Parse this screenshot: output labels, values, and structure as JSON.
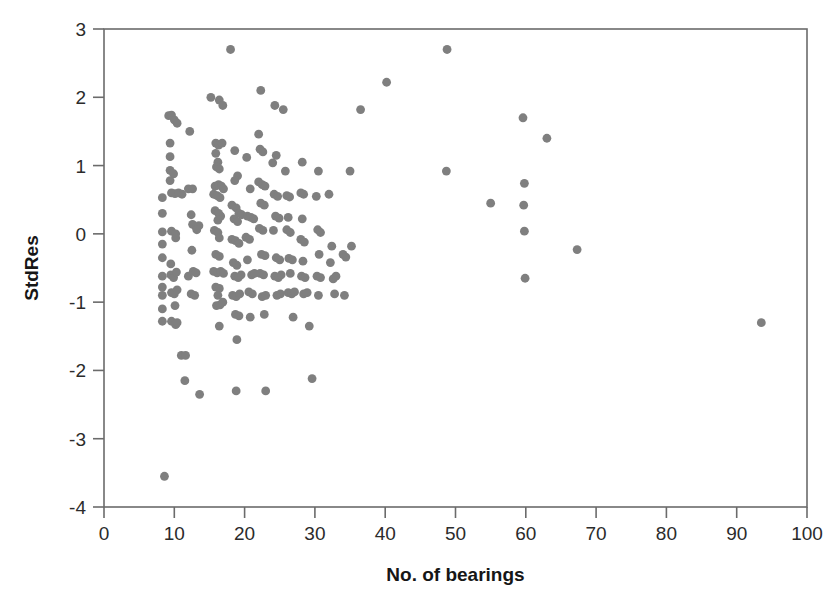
{
  "chart_data": {
    "type": "scatter",
    "title": "",
    "xlabel": "No. of bearings",
    "ylabel": "StdRes",
    "xlim": [
      0,
      100
    ],
    "ylim": [
      -4,
      3
    ],
    "xticks": [
      0,
      10,
      20,
      30,
      40,
      50,
      60,
      70,
      80,
      90,
      100
    ],
    "yticks": [
      -4,
      -3,
      -2,
      -1,
      0,
      1,
      2,
      3
    ],
    "xtick_labels": [
      "0",
      "10",
      "20",
      "30",
      "40",
      "50",
      "60",
      "70",
      "80",
      "90",
      "100"
    ],
    "ytick_labels": [
      "-4",
      "-3",
      "-2",
      "-1",
      "0",
      "1",
      "2",
      "3"
    ],
    "grid": false,
    "legend": null,
    "marker": {
      "shape": "circle",
      "color": "#7f7f7f",
      "size": 4.4
    },
    "series": [
      {
        "name": "residuals",
        "points": [
          [
            8.6,
            -3.55
          ],
          [
            8.3,
            0.53
          ],
          [
            8.3,
            0.3
          ],
          [
            8.3,
            0.03
          ],
          [
            8.3,
            -0.15
          ],
          [
            8.3,
            -0.35
          ],
          [
            8.3,
            -0.62
          ],
          [
            8.3,
            -0.78
          ],
          [
            8.3,
            -0.9
          ],
          [
            8.3,
            -1.1
          ],
          [
            8.3,
            -1.28
          ],
          [
            9.2,
            1.73
          ],
          [
            9.6,
            1.74
          ],
          [
            10.0,
            1.67
          ],
          [
            10.4,
            1.62
          ],
          [
            9.4,
            1.33
          ],
          [
            9.4,
            1.13
          ],
          [
            9.4,
            0.93
          ],
          [
            9.9,
            0.88
          ],
          [
            9.4,
            0.78
          ],
          [
            9.6,
            0.6
          ],
          [
            10.1,
            0.59
          ],
          [
            10.6,
            0.6
          ],
          [
            11.1,
            0.58
          ],
          [
            9.6,
            0.04
          ],
          [
            10.2,
            0.0
          ],
          [
            10.2,
            -0.06
          ],
          [
            9.5,
            -0.44
          ],
          [
            9.5,
            -0.6
          ],
          [
            9.9,
            -0.64
          ],
          [
            10.3,
            -0.56
          ],
          [
            9.6,
            -0.86
          ],
          [
            10.0,
            -0.88
          ],
          [
            10.4,
            -0.82
          ],
          [
            10.1,
            -1.05
          ],
          [
            9.6,
            -1.28
          ],
          [
            10.2,
            -1.33
          ],
          [
            10.4,
            -1.3
          ],
          [
            11.0,
            -1.78
          ],
          [
            11.6,
            -1.78
          ],
          [
            11.5,
            -2.15
          ],
          [
            12.2,
            1.5
          ],
          [
            12.0,
            0.66
          ],
          [
            12.6,
            0.66
          ],
          [
            12.4,
            0.28
          ],
          [
            12.6,
            0.14
          ],
          [
            13.1,
            0.1
          ],
          [
            13.5,
            0.12
          ],
          [
            13.2,
            0.06
          ],
          [
            12.5,
            -0.24
          ],
          [
            12.0,
            -0.62
          ],
          [
            12.7,
            -0.55
          ],
          [
            13.1,
            -0.57
          ],
          [
            12.4,
            -0.88
          ],
          [
            12.9,
            -0.9
          ],
          [
            13.6,
            -2.35
          ],
          [
            15.2,
            2.0
          ],
          [
            16.4,
            1.96
          ],
          [
            16.9,
            1.88
          ],
          [
            15.9,
            1.33
          ],
          [
            16.3,
            1.3
          ],
          [
            16.8,
            1.33
          ],
          [
            15.9,
            1.18
          ],
          [
            16.2,
            1.05
          ],
          [
            16.0,
            0.98
          ],
          [
            16.4,
            0.95
          ],
          [
            15.8,
            0.7
          ],
          [
            16.3,
            0.72
          ],
          [
            16.7,
            0.7
          ],
          [
            17.0,
            0.66
          ],
          [
            15.6,
            0.58
          ],
          [
            16.1,
            0.56
          ],
          [
            16.5,
            0.53
          ],
          [
            15.8,
            0.34
          ],
          [
            16.3,
            0.3
          ],
          [
            16.6,
            0.26
          ],
          [
            16.2,
            0.2
          ],
          [
            15.7,
            0.05
          ],
          [
            16.2,
            0.02
          ],
          [
            16.4,
            -0.06
          ],
          [
            15.9,
            -0.3
          ],
          [
            16.4,
            -0.33
          ],
          [
            15.6,
            -0.55
          ],
          [
            16.1,
            -0.57
          ],
          [
            16.6,
            -0.55
          ],
          [
            17.0,
            -0.58
          ],
          [
            15.9,
            -0.78
          ],
          [
            16.4,
            -0.8
          ],
          [
            16.2,
            -0.9
          ],
          [
            16.0,
            -1.05
          ],
          [
            16.5,
            -1.04
          ],
          [
            16.9,
            -1.0
          ],
          [
            16.4,
            -1.35
          ],
          [
            18.0,
            2.7
          ],
          [
            18.6,
            1.22
          ],
          [
            19.0,
            0.85
          ],
          [
            18.6,
            0.78
          ],
          [
            18.2,
            0.42
          ],
          [
            18.8,
            0.38
          ],
          [
            19.2,
            0.3
          ],
          [
            19.6,
            0.28
          ],
          [
            18.5,
            0.22
          ],
          [
            19.0,
            0.18
          ],
          [
            18.2,
            -0.08
          ],
          [
            18.7,
            -0.1
          ],
          [
            19.2,
            -0.14
          ],
          [
            18.4,
            -0.42
          ],
          [
            18.9,
            -0.46
          ],
          [
            18.6,
            -0.62
          ],
          [
            19.1,
            -0.64
          ],
          [
            19.5,
            -0.6
          ],
          [
            18.3,
            -0.9
          ],
          [
            18.8,
            -0.92
          ],
          [
            19.3,
            -0.88
          ],
          [
            18.7,
            -1.18
          ],
          [
            19.2,
            -1.2
          ],
          [
            18.9,
            -1.55
          ],
          [
            18.8,
            -2.3
          ],
          [
            20.3,
            1.12
          ],
          [
            20.8,
            0.66
          ],
          [
            20.4,
            0.26
          ],
          [
            20.9,
            0.24
          ],
          [
            21.3,
            0.22
          ],
          [
            20.2,
            -0.05
          ],
          [
            20.7,
            -0.08
          ],
          [
            20.4,
            -0.38
          ],
          [
            21.0,
            -0.6
          ],
          [
            21.4,
            -0.58
          ],
          [
            20.6,
            -0.85
          ],
          [
            21.1,
            -0.88
          ],
          [
            20.8,
            -1.22
          ],
          [
            22.3,
            2.1
          ],
          [
            22.0,
            1.46
          ],
          [
            22.2,
            1.24
          ],
          [
            22.6,
            1.2
          ],
          [
            22.0,
            0.76
          ],
          [
            22.5,
            0.72
          ],
          [
            22.9,
            0.7
          ],
          [
            22.3,
            0.45
          ],
          [
            22.8,
            0.42
          ],
          [
            22.1,
            0.08
          ],
          [
            22.6,
            0.05
          ],
          [
            22.4,
            -0.3
          ],
          [
            22.9,
            -0.32
          ],
          [
            22.2,
            -0.58
          ],
          [
            22.7,
            -0.6
          ],
          [
            22.5,
            -0.92
          ],
          [
            23.0,
            -0.9
          ],
          [
            22.8,
            -1.18
          ],
          [
            23.0,
            -2.3
          ],
          [
            24.3,
            1.88
          ],
          [
            24.5,
            1.15
          ],
          [
            24.0,
            1.04
          ],
          [
            24.2,
            0.58
          ],
          [
            24.7,
            0.55
          ],
          [
            24.4,
            0.26
          ],
          [
            24.9,
            0.23
          ],
          [
            24.1,
            0.05
          ],
          [
            24.5,
            -0.35
          ],
          [
            25.0,
            -0.38
          ],
          [
            24.3,
            -0.62
          ],
          [
            24.8,
            -0.64
          ],
          [
            25.2,
            -0.6
          ],
          [
            24.6,
            -0.9
          ],
          [
            25.1,
            -0.88
          ],
          [
            25.5,
            1.82
          ],
          [
            25.8,
            0.92
          ],
          [
            26.0,
            0.56
          ],
          [
            26.4,
            0.54
          ],
          [
            26.2,
            0.24
          ],
          [
            26.0,
            0.06
          ],
          [
            26.5,
            0.02
          ],
          [
            26.3,
            -0.36
          ],
          [
            26.8,
            -0.38
          ],
          [
            26.5,
            -0.58
          ],
          [
            26.2,
            -0.86
          ],
          [
            26.7,
            -0.88
          ],
          [
            27.1,
            -0.85
          ],
          [
            26.9,
            -1.22
          ],
          [
            28.2,
            1.05
          ],
          [
            28.0,
            0.6
          ],
          [
            28.4,
            0.58
          ],
          [
            28.2,
            0.22
          ],
          [
            28.0,
            -0.08
          ],
          [
            28.5,
            -0.12
          ],
          [
            28.3,
            -0.4
          ],
          [
            28.1,
            -0.62
          ],
          [
            28.6,
            -0.64
          ],
          [
            28.4,
            -0.88
          ],
          [
            28.9,
            -0.86
          ],
          [
            29.2,
            -1.35
          ],
          [
            29.6,
            -2.12
          ],
          [
            30.5,
            0.92
          ],
          [
            30.2,
            0.55
          ],
          [
            30.4,
            0.06
          ],
          [
            30.8,
            0.02
          ],
          [
            30.6,
            -0.3
          ],
          [
            30.3,
            -0.62
          ],
          [
            30.8,
            -0.64
          ],
          [
            30.5,
            -0.9
          ],
          [
            32.0,
            0.58
          ],
          [
            32.4,
            -0.18
          ],
          [
            32.2,
            -0.42
          ],
          [
            32.6,
            -0.66
          ],
          [
            33.0,
            -0.62
          ],
          [
            32.8,
            -0.88
          ],
          [
            34.0,
            -0.3
          ],
          [
            34.4,
            -0.34
          ],
          [
            34.2,
            -0.9
          ],
          [
            35.0,
            0.92
          ],
          [
            35.2,
            -0.18
          ],
          [
            36.5,
            1.82
          ],
          [
            40.2,
            2.22
          ],
          [
            48.8,
            2.7
          ],
          [
            48.7,
            0.92
          ],
          [
            55.0,
            0.45
          ],
          [
            59.6,
            1.7
          ],
          [
            59.8,
            0.74
          ],
          [
            59.7,
            0.42
          ],
          [
            59.8,
            0.04
          ],
          [
            59.9,
            -0.65
          ],
          [
            63.0,
            1.4
          ],
          [
            67.3,
            -0.23
          ],
          [
            93.5,
            -1.3
          ]
        ]
      }
    ]
  },
  "figure": {
    "background": "#ffffff",
    "axis_color": "#6b6b6b",
    "text_color": "#2b2b2b",
    "point_color": "#7f7f7f"
  }
}
